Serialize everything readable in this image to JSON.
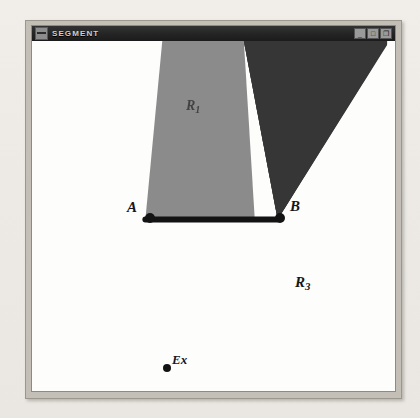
{
  "page": {
    "background_color": "#efece7",
    "ghost_text": [
      {
        "text": "as show",
        "x": 228,
        "y": 38,
        "size": 13
      },
      {
        "text": "o",
        "x": 150,
        "y": 58,
        "size": 12
      },
      {
        "text": "or no",
        "x": 96,
        "y": 78,
        "size": 13
      },
      {
        "text": "terms th",
        "x": 196,
        "y": 78,
        "size": 13
      },
      {
        "text": "hi",
        "x": 150,
        "y": 98,
        "size": 12
      },
      {
        "text": "the ter",
        "x": 208,
        "y": 98,
        "size": 13
      },
      {
        "text": "ere  or",
        "x": 186,
        "y": 150,
        "size": 13
      },
      {
        "text": "is and we are",
        "x": 86,
        "y": 170,
        "size": 13
      },
      {
        "text": "con   and",
        "x": 92,
        "y": 190,
        "size": 13
      },
      {
        "text": "e long  ly that",
        "x": 76,
        "y": 210,
        "size": 13
      },
      {
        "text": "on",
        "x": 118,
        "y": 230,
        "size": 13
      },
      {
        "text": "g",
        "x": 330,
        "y": 110,
        "size": 13
      },
      {
        "text": "t",
        "x": 344,
        "y": 248,
        "size": 13
      },
      {
        "text": "th",
        "x": 40,
        "y": 300,
        "size": 13
      },
      {
        "text": "in",
        "x": 26,
        "y": 132,
        "size": 13
      }
    ]
  },
  "window": {
    "titlebar": {
      "icon": "system-menu-icon",
      "title": "SEGMENT",
      "buttons": [
        {
          "name": "minimize-button",
          "glyph": "_"
        },
        {
          "name": "maximize-button",
          "glyph": "□"
        },
        {
          "name": "restore-button",
          "glyph": "❐"
        }
      ]
    },
    "frame_color": "#c3bfb7",
    "titlebar_color": "#242424",
    "canvas_color": "#fdfdfc"
  },
  "diagram": {
    "title": "SEGMENT",
    "regions": [
      {
        "id": "region-r1",
        "label": "R",
        "subscript": "1",
        "fill": "#8b8b8b",
        "description": "light gray wedge above segment AB, apex at A"
      },
      {
        "id": "region-r2",
        "label": "",
        "subscript": "",
        "fill": "#363636",
        "description": "dark wedge above-right of segment AB, apex at B"
      },
      {
        "id": "region-r3",
        "label": "R",
        "subscript": "3",
        "fill": "#fdfdfc",
        "description": "white exterior region below segment AB"
      }
    ],
    "points": [
      {
        "id": "point-a",
        "label": "A",
        "x": 148,
        "y": 213,
        "dot": true
      },
      {
        "id": "point-b",
        "label": "B",
        "x": 281,
        "y": 213,
        "dot": true
      },
      {
        "id": "point-ex",
        "label": "Ex",
        "x": 165,
        "y": 362,
        "dot": true
      }
    ],
    "segment": {
      "id": "segment-ab",
      "from": "A",
      "to": "B",
      "color": "#131313",
      "width": 5
    },
    "labels": {
      "a": "A",
      "b": "B",
      "r1": "R",
      "r1_sub": "1",
      "r3": "R",
      "r3_sub": "3",
      "ex": "Ex"
    }
  }
}
